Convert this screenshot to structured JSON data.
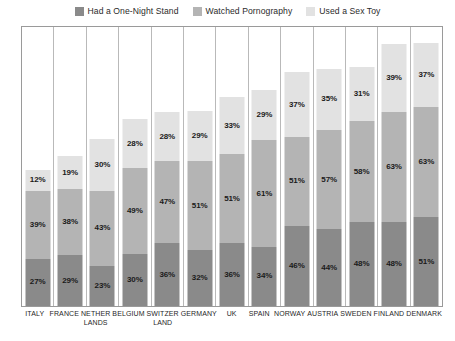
{
  "legend": {
    "entries": [
      {
        "label": "Had a One-Night Stand",
        "color": "#8a8a8a",
        "key": "stand"
      },
      {
        "label": "Watched Pornography",
        "color": "#b4b4b4",
        "key": "porn"
      },
      {
        "label": "Used a Sex Toy",
        "color": "#e2e2e2",
        "key": "toy"
      }
    ]
  },
  "chart_data": {
    "type": "bar",
    "title": "",
    "subtitle": "",
    "xlabel": "",
    "ylabel": "",
    "stacked": true,
    "grid": false,
    "legend_position": "top-center",
    "value_suffix": "%",
    "ylim": [
      0,
      160
    ],
    "categories": [
      "ITALY",
      "FRANCE",
      "NETHER LANDS",
      "BELGIUM",
      "SWITZER LAND",
      "GERMANY",
      "UK",
      "SPAIN",
      "NORWAY",
      "AUSTRIA",
      "SWEDEN",
      "FINLAND",
      "DENMARK"
    ],
    "category_lines": [
      [
        "ITALY"
      ],
      [
        "FRANCE"
      ],
      [
        "NETHER",
        "LANDS"
      ],
      [
        "BELGIUM"
      ],
      [
        "SWITZER",
        "LAND"
      ],
      [
        "GERMANY"
      ],
      [
        "UK"
      ],
      [
        "SPAIN"
      ],
      [
        "NORWAY"
      ],
      [
        "AUSTRIA"
      ],
      [
        "SWEDEN"
      ],
      [
        "FINLAND"
      ],
      [
        "DENMARK"
      ]
    ],
    "series": [
      {
        "name": "Had a One-Night Stand",
        "key": "stand",
        "color": "#8a8a8a",
        "values": [
          27,
          29,
          23,
          30,
          36,
          32,
          36,
          34,
          46,
          44,
          48,
          48,
          51
        ],
        "labels": [
          "27%",
          "29%",
          "23%",
          "30%",
          "36%",
          "32%",
          "36%",
          "34%",
          "46%",
          "44%",
          "48%",
          "48%",
          "51%"
        ]
      },
      {
        "name": "Watched Pornography",
        "key": "porn",
        "color": "#b4b4b4",
        "values": [
          39,
          38,
          43,
          49,
          47,
          51,
          51,
          61,
          51,
          57,
          58,
          63,
          63
        ],
        "labels": [
          "39%",
          "38%",
          "43%",
          "49%",
          "47%",
          "51%",
          "51%",
          "61%",
          "51%",
          "57%",
          "58%",
          "63%",
          "63%"
        ]
      },
      {
        "name": "Used a Sex Toy",
        "key": "toy",
        "color": "#e2e2e2",
        "values": [
          12,
          19,
          30,
          28,
          28,
          29,
          33,
          29,
          37,
          35,
          31,
          39,
          37
        ],
        "labels": [
          "12%",
          "19%",
          "30%",
          "28%",
          "28%",
          "29%",
          "33%",
          "29%",
          "37%",
          "35%",
          "31%",
          "39%",
          "37%"
        ]
      }
    ],
    "stack_order_bottom_to_top": [
      "stand",
      "porn",
      "toy"
    ],
    "totals": [
      78,
      86,
      96,
      107,
      111,
      112,
      120,
      124,
      134,
      136,
      137,
      150,
      151
    ]
  }
}
